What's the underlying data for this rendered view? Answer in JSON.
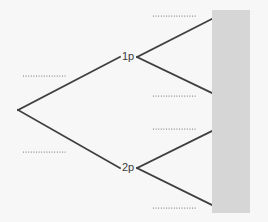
{
  "figure": {
    "type": "probability-tree-diagram",
    "background_color": "#f7f7f7",
    "line_color": "#3f3f3f",
    "blank_color": "#8d8d8d",
    "mask_color": "#d6d6d6"
  },
  "nodes": {
    "root": {
      "label": "",
      "x": 18,
      "y": 110
    },
    "first_level": [
      {
        "id": "node-1p",
        "label": "1p",
        "x": 128,
        "y": 57
      },
      {
        "id": "node-2p",
        "label": "2p",
        "x": 128,
        "y": 168
      }
    ]
  },
  "branches": [
    {
      "id": "branch-root-to-1p",
      "from": "root",
      "to": "node-1p"
    },
    {
      "id": "branch-root-to-2p",
      "from": "root",
      "to": "node-2p"
    },
    {
      "id": "branch-1p-upper",
      "from": "node-1p",
      "to": "outcome-1"
    },
    {
      "id": "branch-1p-lower",
      "from": "node-1p",
      "to": "outcome-2"
    },
    {
      "id": "branch-2p-upper",
      "from": "node-2p",
      "to": "outcome-3"
    },
    {
      "id": "branch-2p-lower",
      "from": "node-2p",
      "to": "outcome-4"
    }
  ],
  "blank_labels": [
    {
      "id": "blank-root-upper",
      "value": "",
      "x1": 23,
      "y1": 76,
      "x2": 66,
      "y2": 76
    },
    {
      "id": "blank-root-lower",
      "value": "",
      "x1": 23,
      "y1": 152,
      "x2": 66,
      "y2": 152
    },
    {
      "id": "blank-1p-upper",
      "value": "",
      "x1": 153,
      "y1": 16,
      "x2": 196,
      "y2": 16
    },
    {
      "id": "blank-1p-lower",
      "value": "",
      "x1": 153,
      "y1": 96,
      "x2": 196,
      "y2": 96
    },
    {
      "id": "blank-2p-upper",
      "value": "",
      "x1": 153,
      "y1": 129,
      "x2": 196,
      "y2": 129
    },
    {
      "id": "blank-2p-lower",
      "value": "",
      "x1": 153,
      "y1": 208,
      "x2": 196,
      "y2": 208
    }
  ],
  "mask": {
    "id": "outcome-mask",
    "x": 212,
    "y": 10,
    "width": 38,
    "height": 203
  }
}
